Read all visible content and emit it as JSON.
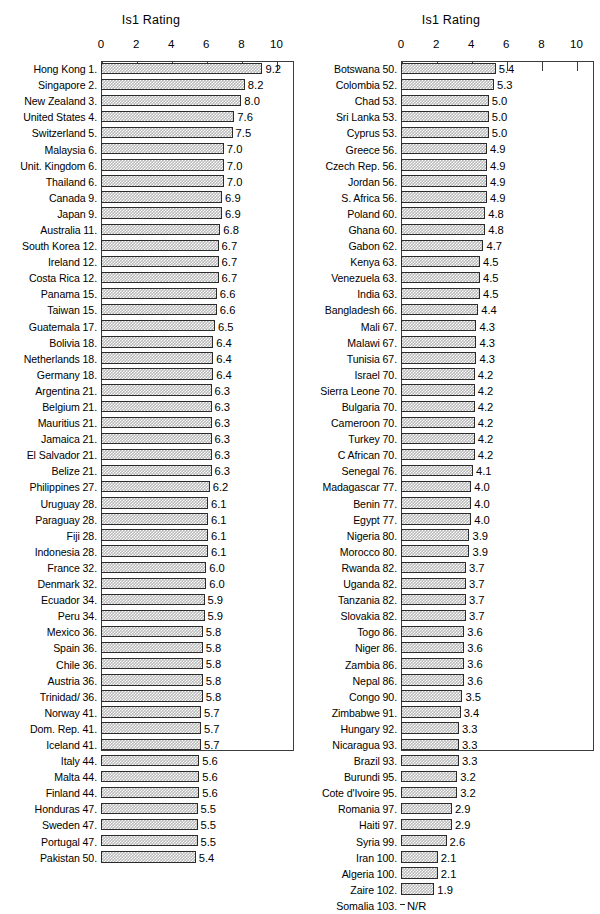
{
  "chart_data": {
    "type": "bar",
    "title": "Is1 Rating",
    "xlabel": "",
    "ylabel": "",
    "orientation": "horizontal",
    "xlim": [
      0,
      11
    ],
    "xticks": [
      0,
      2,
      4,
      6,
      8,
      10
    ],
    "grid": false,
    "legend": null,
    "panels": [
      {
        "title": "Is1 Rating",
        "categories": [
          "Hong Kong 1.",
          "Singapore 2.",
          "New Zealand 3.",
          "United States 4.",
          "Switzerland 5.",
          "Malaysia 6.",
          "Unit. Kingdom 6.",
          "Thailand 6.",
          "Canada 9.",
          "Japan 9.",
          "Australia 11.",
          "South Korea 12.",
          "Ireland 12.",
          "Costa Rica 12.",
          "Panama 15.",
          "Taiwan 15.",
          "Guatemala 17.",
          "Bolivia 18.",
          "Netherlands 18.",
          "Germany 18.",
          "Argentina 21.",
          "Belgium 21.",
          "Mauritius 21.",
          "Jamaica 21.",
          "El Salvador 21.",
          "Belize 21.",
          "Philippines 27.",
          "Uruguay 28.",
          "Paraguay 28.",
          "Fiji 28.",
          "Indonesia 28.",
          "France 32.",
          "Denmark 32.",
          "Ecuador 34.",
          "Peru 34.",
          "Mexico 36.",
          "Spain 36.",
          "Chile 36.",
          "Austria 36.",
          "Trinidad/ 36.",
          "Norway 41.",
          "Dom. Rep. 41.",
          "Iceland 41.",
          "Italy 44.",
          "Malta 44.",
          "Finland 44.",
          "Honduras 47.",
          "Sweden 47.",
          "Portugal 47.",
          "Pakistan 50."
        ],
        "values": [
          9.2,
          8.2,
          8.0,
          7.6,
          7.5,
          7.0,
          7.0,
          7.0,
          6.9,
          6.9,
          6.8,
          6.7,
          6.7,
          6.7,
          6.6,
          6.6,
          6.5,
          6.4,
          6.4,
          6.4,
          6.3,
          6.3,
          6.3,
          6.3,
          6.3,
          6.3,
          6.2,
          6.1,
          6.1,
          6.1,
          6.1,
          6.0,
          6.0,
          5.9,
          5.9,
          5.8,
          5.8,
          5.8,
          5.8,
          5.8,
          5.7,
          5.7,
          5.7,
          5.6,
          5.6,
          5.6,
          5.5,
          5.5,
          5.5,
          5.4
        ],
        "labels": [
          "9.2",
          "8.2",
          "8.0",
          "7.6",
          "7.5",
          "7.0",
          "7.0",
          "7.0",
          "6.9",
          "6.9",
          "6.8",
          "6.7",
          "6.7",
          "6.7",
          "6.6",
          "6.6",
          "6.5",
          "6.4",
          "6.4",
          "6.4",
          "6.3",
          "6.3",
          "6.3",
          "6.3",
          "6.3",
          "6.3",
          "6.2",
          "6.1",
          "6.1",
          "6.1",
          "6.1",
          "6.0",
          "6.0",
          "5.9",
          "5.9",
          "5.8",
          "5.8",
          "5.8",
          "5.8",
          "5.8",
          "5.7",
          "5.7",
          "5.7",
          "5.6",
          "5.6",
          "5.6",
          "5.5",
          "5.5",
          "5.5",
          "5.4"
        ]
      },
      {
        "title": "Is1 Rating",
        "categories": [
          "Botswana 50.",
          "Colombia 52.",
          "Chad 53.",
          "Sri Lanka 53.",
          "Cyprus 53.",
          "Greece 56.",
          "Czech Rep. 56.",
          "Jordan 56.",
          "S. Africa 56.",
          "Poland 60.",
          "Ghana 60.",
          "Gabon 62.",
          "Kenya 63.",
          "Venezuela 63.",
          "India 63.",
          "Bangladesh 66.",
          "Mali 67.",
          "Malawi 67.",
          "Tunisia 67.",
          "Israel 70.",
          "Sierra Leone 70.",
          "Bulgaria 70.",
          "Cameroon 70.",
          "Turkey 70.",
          "C African 70.",
          "Senegal 76.",
          "Madagascar 77.",
          "Benin 77.",
          "Egypt 77.",
          "Nigeria 80.",
          "Morocco 80.",
          "Rwanda 82.",
          "Uganda 82.",
          "Tanzania 82.",
          "Slovakia 82.",
          "Togo 86.",
          "Niger 86.",
          "Zambia 86.",
          "Nepal 86.",
          "Congo  90.",
          "Zimbabwe 91.",
          "Hungary 92.",
          "Nicaragua 93.",
          "Brazil 93.",
          "Burundi 95.",
          "Cote d'Ivoire 95.",
          "Romania 97.",
          "Haiti 97.",
          "Syria 99.",
          "Iran 100.",
          "Algeria 100.",
          "Zaire 102.",
          "Somalia 103."
        ],
        "values": [
          5.4,
          5.3,
          5.0,
          5.0,
          5.0,
          4.9,
          4.9,
          4.9,
          4.9,
          4.8,
          4.8,
          4.7,
          4.5,
          4.5,
          4.5,
          4.4,
          4.3,
          4.3,
          4.3,
          4.2,
          4.2,
          4.2,
          4.2,
          4.2,
          4.2,
          4.1,
          4.0,
          4.0,
          4.0,
          3.9,
          3.9,
          3.7,
          3.7,
          3.7,
          3.7,
          3.6,
          3.6,
          3.6,
          3.6,
          3.5,
          3.4,
          3.3,
          3.3,
          3.3,
          3.2,
          3.2,
          2.9,
          2.9,
          2.6,
          2.1,
          2.1,
          1.9,
          0
        ],
        "labels": [
          "5.4",
          "5.3",
          "5.0",
          "5.0",
          "5.0",
          "4.9",
          "4.9",
          "4.9",
          "4.9",
          "4.8",
          "4.8",
          "4.7",
          "4.5",
          "4.5",
          "4.5",
          "4.4",
          "4.3",
          "4.3",
          "4.3",
          "4.2",
          "4.2",
          "4.2",
          "4.2",
          "4.2",
          "4.2",
          "4.1",
          "4.0",
          "4.0",
          "4.0",
          "3.9",
          "3.9",
          "3.7",
          "3.7",
          "3.7",
          "3.7",
          "3.6",
          "3.6",
          "3.6",
          "3.6",
          "3.5",
          "3.4",
          "3.3",
          "3.3",
          "3.3",
          "3.2",
          "3.2",
          "2.9",
          "2.9",
          "2.6",
          "2.1",
          "2.1",
          "1.9",
          "N/R"
        ]
      }
    ]
  },
  "colors": {
    "bar_fill": "#b9b9b9",
    "bar_border": "#2b2b2b",
    "frame": "#3c3c3c",
    "text": "#000000",
    "background": "#ffffff"
  }
}
